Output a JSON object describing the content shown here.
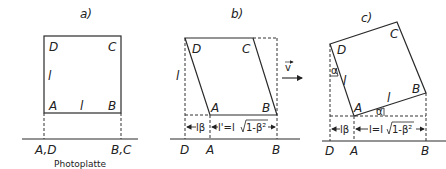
{
  "panels": [
    {
      "id": "a",
      "title": "a)",
      "corners": {
        "A": "A",
        "B": "B",
        "C": "C",
        "D": "D"
      },
      "side_labels": {
        "left": "l",
        "bottom": "l"
      },
      "projection_labels": [
        "A,D",
        "B,C"
      ],
      "caption": "Photoplatte"
    },
    {
      "id": "b",
      "title": "b)",
      "corners": {
        "A": "A",
        "B": "B",
        "C": "C",
        "D": "D"
      },
      "side_labels": {
        "left": "l"
      },
      "measure_left": "lβ",
      "measure_right": "l'=l √1-β²",
      "measure_right_prefix": "l'=l ",
      "measure_right_root": "1-β²",
      "projection_labels": [
        "D",
        "A",
        "B"
      ]
    },
    {
      "id": "c",
      "title": "c)",
      "corners": {
        "A": "A",
        "B": "B",
        "C": "C",
        "D": "D"
      },
      "side_labels": {
        "left": "l",
        "bottom": "l"
      },
      "angle_labels": [
        "α",
        "α"
      ],
      "measure_left": "lβ",
      "measure_right": "l=l√1-β²",
      "measure_right_prefix": "l=l",
      "measure_right_root": "1-β²",
      "projection_labels": [
        "D",
        "A",
        "B"
      ]
    }
  ],
  "velocity": {
    "label": "v",
    "icon": "arrow-right-icon"
  }
}
